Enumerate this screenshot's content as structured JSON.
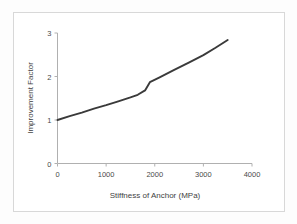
{
  "figure": {
    "background_color": "#ffffff",
    "border_color": "#d8d8d8",
    "line_color": "#3a3a3a",
    "axis_color": "#b0b0b0"
  },
  "chart_data": {
    "type": "line",
    "title": "",
    "xlabel": "Stiffness of Anchor (MPa)",
    "ylabel": "Improvement Factor",
    "xlim": [
      0,
      4000
    ],
    "ylim": [
      0,
      3
    ],
    "xticks": [
      "0",
      "1000",
      "2000",
      "3000",
      "4000"
    ],
    "xtick_values": [
      0,
      1000,
      2000,
      3000,
      4000
    ],
    "yticks": [
      "0",
      "1",
      "2",
      "3"
    ],
    "ytick_values": [
      0,
      1,
      2,
      3
    ],
    "grid": false,
    "legend": false,
    "series": [
      {
        "name": "Improvement Factor",
        "x": [
          0,
          250,
          500,
          750,
          1000,
          1250,
          1500,
          1650,
          1800,
          1900,
          2100,
          2400,
          2700,
          3000,
          3250,
          3500
        ],
        "values": [
          1.0,
          1.09,
          1.17,
          1.26,
          1.34,
          1.43,
          1.52,
          1.58,
          1.68,
          1.87,
          1.98,
          2.15,
          2.32,
          2.49,
          2.66,
          2.84
        ]
      }
    ]
  }
}
